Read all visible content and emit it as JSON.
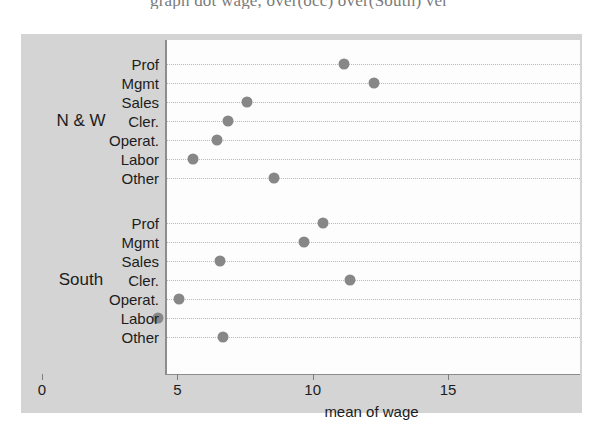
{
  "caption": {
    "text": "graph dot wage, over(occ) over(South) ver"
  },
  "chart_data": {
    "type": "scatter",
    "title": "",
    "subtitle": "",
    "xlabel": "mean of wage",
    "ylabel": "",
    "xlim": [
      0,
      15
    ],
    "xticks": [
      0,
      5,
      10,
      15
    ],
    "xticklabels": [
      "0",
      "5",
      "10",
      "15"
    ],
    "grid": true,
    "grid_style": "dotted-horizontal",
    "legend": "none",
    "orientation": "horizontal",
    "marker": "filled-circle",
    "marker_color": "#878787",
    "panel_background": "#d4d4d4",
    "plot_background": "#fdfdfd",
    "categories": [
      "Prof",
      "Mgmt",
      "Sales",
      "Cler.",
      "Operat.",
      "Labor",
      "Other"
    ],
    "groups": [
      {
        "name": "N & W",
        "values": [
          11.1,
          12.2,
          7.5,
          6.8,
          6.4,
          5.5,
          8.5
        ]
      },
      {
        "name": "South",
        "values": [
          10.3,
          9.6,
          6.5,
          11.3,
          5.0,
          4.2,
          6.6
        ]
      }
    ]
  }
}
